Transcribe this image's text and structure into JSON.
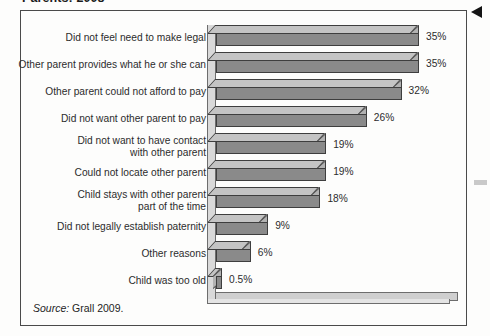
{
  "figure": {
    "title": "Parents: 2008",
    "source_prefix": "Source:",
    "source_text": "Grall 2009."
  },
  "colors": {
    "bar_front": "#8a8a8a",
    "bar_top": "#c4c4c4",
    "bar_side": "#b2b2b2",
    "bar_outline": "#3e3e3e",
    "frame": "#4a4a4a",
    "floor": "#cfcfcf",
    "page_background": "#fdfdfc",
    "text": "#2c2c2c"
  },
  "chart_data": {
    "type": "bar",
    "orientation": "horizontal",
    "style": "3d",
    "title": "Parents: 2008",
    "xlabel": "",
    "ylabel": "",
    "xlim": [
      0,
      40
    ],
    "grid": false,
    "legend": null,
    "categories": [
      "Did not feel need to make legal",
      "Other parent provides what he or she can",
      "Other parent could not afford to pay",
      "Did not want other parent to pay",
      "Did not want to have contact\nwith other parent",
      "Could not locate other parent",
      "Child stays with other parent\npart of the time",
      "Did not legally establish paternity",
      "Other reasons",
      "Child was too old"
    ],
    "values": [
      35,
      35,
      32,
      26,
      19,
      19,
      18,
      9,
      6,
      0.5
    ],
    "value_labels": [
      "35%",
      "35%",
      "32%",
      "26%",
      "19%",
      "19%",
      "18%",
      "9%",
      "6%",
      "0.5%"
    ]
  }
}
